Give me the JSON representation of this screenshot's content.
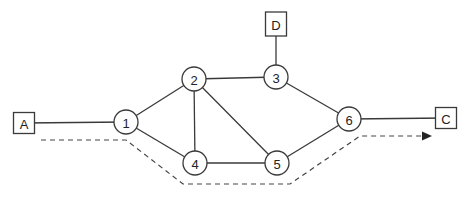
{
  "diagram": {
    "type": "network-graph",
    "routers": [
      {
        "id": "1",
        "label": "1"
      },
      {
        "id": "2",
        "label": "2"
      },
      {
        "id": "3",
        "label": "3"
      },
      {
        "id": "4",
        "label": "4"
      },
      {
        "id": "5",
        "label": "5"
      },
      {
        "id": "6",
        "label": "6"
      }
    ],
    "hosts": [
      {
        "id": "A",
        "label": "A"
      },
      {
        "id": "D",
        "label": "D"
      },
      {
        "id": "C",
        "label": "C"
      }
    ],
    "links": [
      [
        "A",
        "1"
      ],
      [
        "1",
        "2"
      ],
      [
        "1",
        "4"
      ],
      [
        "2",
        "3"
      ],
      [
        "2",
        "4"
      ],
      [
        "2",
        "5"
      ],
      [
        "4",
        "5"
      ],
      [
        "3",
        "6"
      ],
      [
        "5",
        "6"
      ],
      [
        "3",
        "D"
      ],
      [
        "6",
        "C"
      ]
    ],
    "route": {
      "style": "dashed",
      "path": [
        "A",
        "1",
        "4",
        "5",
        "6",
        "C"
      ],
      "arrow": "end"
    },
    "colors": {
      "line": "#3a3a3a",
      "background": "#ffffff"
    }
  }
}
